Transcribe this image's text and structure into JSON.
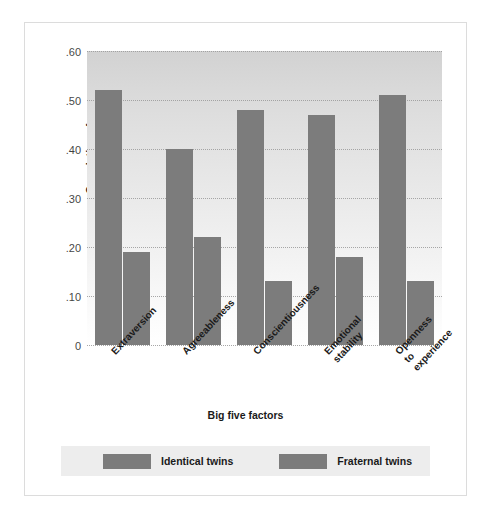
{
  "chart_data": {
    "type": "bar",
    "title": "",
    "xlabel": "Big five factors",
    "ylabel": "Correlation of scores",
    "categories": [
      "Extraversion",
      "Agreeableness",
      "Conscientiousness",
      "Emotional\nstability",
      "Openness\nto\nexperience"
    ],
    "series": [
      {
        "name": "Identical twins",
        "values": [
          0.52,
          0.4,
          0.48,
          0.47,
          0.51
        ]
      },
      {
        "name": "Fraternal twins",
        "values": [
          0.19,
          0.22,
          0.13,
          0.18,
          0.13
        ]
      }
    ],
    "ylim": [
      0,
      0.6
    ],
    "yticks": [
      0,
      0.1,
      0.2,
      0.3,
      0.4,
      0.5,
      0.6
    ],
    "ytick_labels": [
      "0",
      ".10",
      ".20",
      ".30",
      ".40",
      ".50",
      ".60"
    ],
    "grid": true,
    "legend_position": "bottom",
    "bar_color": "#7c7c7c",
    "plot_background_top": "#d2d2d2",
    "plot_background_bottom": "#ffffff"
  }
}
